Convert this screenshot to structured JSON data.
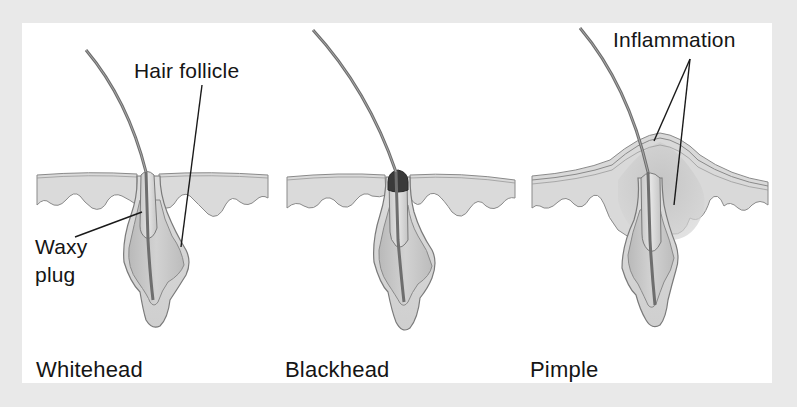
{
  "figure": {
    "panels": [
      {
        "id": "whitehead",
        "caption": "Whitehead",
        "callouts": [
          {
            "text": "Hair follicle",
            "points_to": "follicle wall"
          },
          {
            "text": "Waxy",
            "points_to": "plug in follicle opening"
          },
          {
            "text": "plug",
            "points_to": "plug in follicle opening"
          }
        ]
      },
      {
        "id": "blackhead",
        "caption": "Blackhead",
        "callouts": []
      },
      {
        "id": "pimple",
        "caption": "Pimple",
        "callouts": [
          {
            "text": "Inflammation",
            "points_to": "swollen tissue around follicle (two leader lines)"
          }
        ]
      }
    ]
  },
  "colors": {
    "frame": "#e9e9e9",
    "panel": "#ffffff",
    "skin_fill": "#d9d9d9",
    "gland_fill": "#c4c4c4",
    "outline": "#7a7a7a",
    "leader_line": "#1a1a1a",
    "text": "#151515",
    "blackhead_cap": "#3a3a3a"
  }
}
